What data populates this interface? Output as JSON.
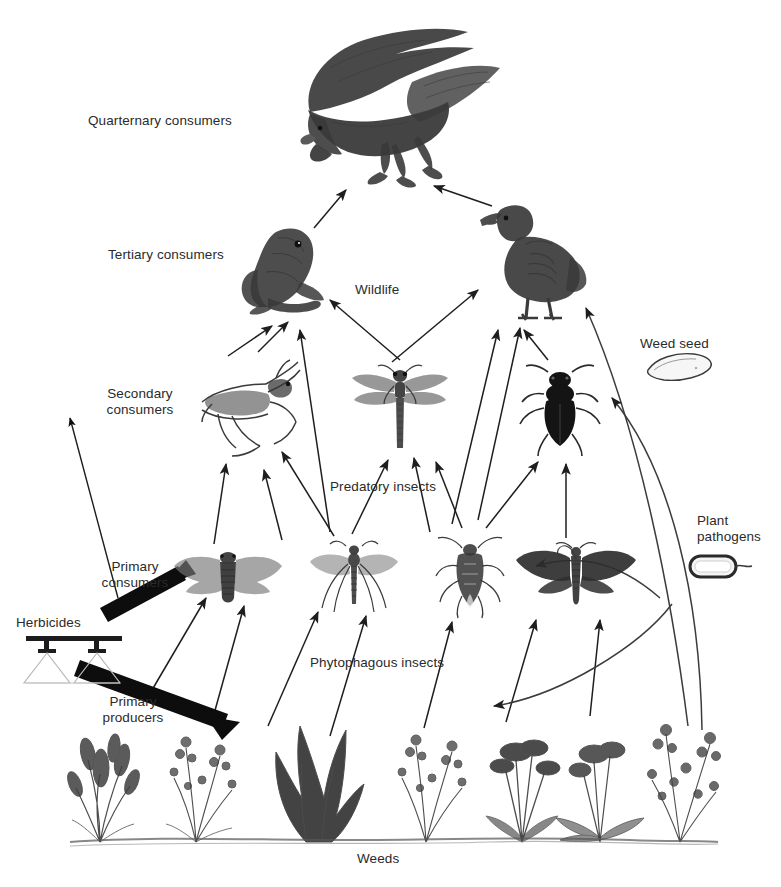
{
  "diagram": {
    "caption": "Weeds",
    "trophic_labels": [
      {
        "id": "quaternary",
        "text": "Quarternary consumers",
        "x": 88,
        "y": 113
      },
      {
        "id": "tertiary",
        "text": "Tertiary consumers",
        "x": 108,
        "y": 247
      },
      {
        "id": "secondary",
        "text": "Secondary\nconsumers",
        "x": 95,
        "y": 386
      },
      {
        "id": "primary-consumers",
        "text": "Primary\nconsumers",
        "x": 92,
        "y": 559
      },
      {
        "id": "primary-producers",
        "text": "Primary\nproducers",
        "x": 92,
        "y": 694
      }
    ],
    "group_labels": [
      {
        "id": "wildlife",
        "text": "Wildlife",
        "x": 355,
        "y": 282
      },
      {
        "id": "predatory-insects",
        "text": "Predatory insects",
        "x": 330,
        "y": 479
      },
      {
        "id": "phytophagous-insects",
        "text": "Phytophagous insects",
        "x": 310,
        "y": 655
      },
      {
        "id": "weeds",
        "text": "Weeds",
        "x": 357,
        "y": 851
      }
    ],
    "side_labels": [
      {
        "id": "weed-seed",
        "text": "Weed seed",
        "x": 640,
        "y": 336
      },
      {
        "id": "plant-pathogens",
        "text": "Plant\npathogens",
        "x": 697,
        "y": 513
      },
      {
        "id": "herbicides",
        "text": "Herbicides",
        "x": 16,
        "y": 615
      }
    ],
    "input": {
      "name": "Herbicides",
      "icon": "sprayer-boom-icon",
      "targets": [
        "Secondary consumers",
        "Primary consumers",
        "Primary producers"
      ]
    },
    "organisms": [
      {
        "id": "raptor",
        "common_name": "bird of prey",
        "level": "Quarternary consumers",
        "x": 292,
        "y": 24,
        "w": 212,
        "h": 168
      },
      {
        "id": "frog",
        "common_name": "frog",
        "level": "Tertiary consumers",
        "x": 238,
        "y": 218,
        "w": 104,
        "h": 104
      },
      {
        "id": "partridge",
        "common_name": "partridge",
        "level": "Tertiary consumers",
        "x": 474,
        "y": 198,
        "w": 118,
        "h": 124
      },
      {
        "id": "mantis",
        "common_name": "praying mantis",
        "level": "Secondary consumers",
        "x": 196,
        "y": 358,
        "w": 116,
        "h": 104
      },
      {
        "id": "dragonfly",
        "common_name": "dragonfly",
        "level": "Secondary consumers",
        "x": 350,
        "y": 364,
        "w": 100,
        "h": 92
      },
      {
        "id": "ground-beetle",
        "common_name": "ground beetle",
        "level": "Secondary consumers",
        "x": 518,
        "y": 364,
        "w": 84,
        "h": 94
      },
      {
        "id": "planthopper",
        "common_name": "cicada / planthopper",
        "level": "Primary consumers",
        "x": 172,
        "y": 548,
        "w": 112,
        "h": 64
      },
      {
        "id": "crane-fly",
        "common_name": "crane fly",
        "level": "Primary consumers",
        "x": 306,
        "y": 540,
        "w": 96,
        "h": 78
      },
      {
        "id": "shield-bug",
        "common_name": "true bug",
        "level": "Primary consumers",
        "x": 434,
        "y": 536,
        "w": 72,
        "h": 84
      },
      {
        "id": "moth",
        "common_name": "moth",
        "level": "Primary consumers",
        "x": 514,
        "y": 542,
        "w": 124,
        "h": 74
      },
      {
        "id": "weed-seed",
        "common_name": "weed seed",
        "level": "Seed bank",
        "x": 646,
        "y": 352,
        "w": 68,
        "h": 30
      },
      {
        "id": "plant-pathogen",
        "common_name": "bacterial plant pathogen",
        "level": "Pathogen",
        "x": 688,
        "y": 552,
        "w": 66,
        "h": 30
      }
    ],
    "weeds_row": {
      "count": 8,
      "baseline_y": 842,
      "x_start": 78,
      "x_end": 706
    },
    "colors": {
      "background": "#ffffff",
      "ink": "#3a3a3a",
      "text": "#2a2a2a",
      "arrow": "#222222"
    }
  }
}
